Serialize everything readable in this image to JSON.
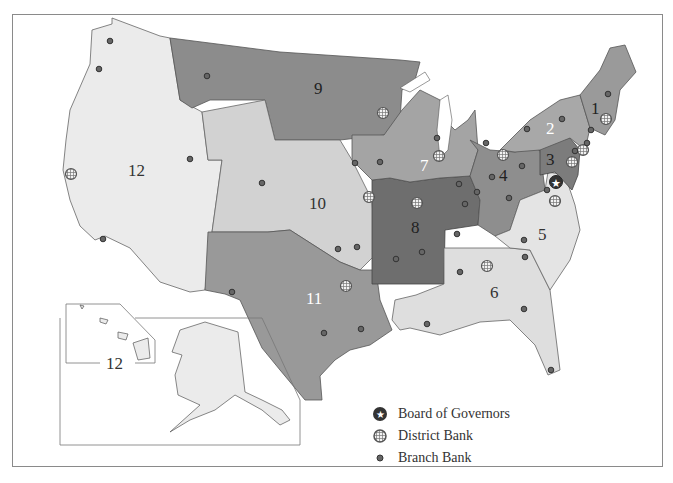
{
  "map": {
    "title": "Federal Reserve Districts",
    "colors": {
      "district_1": "#9a9a9a",
      "district_2": "#a8a8a8",
      "district_3": "#7c7c7c",
      "district_4": "#8e8e8e",
      "district_5": "#e4e4e4",
      "district_6": "#dedede",
      "district_7": "#a4a4a4",
      "district_8": "#6e6e6e",
      "district_9": "#8c8c8c",
      "district_10": "#d2d2d2",
      "district_11": "#999999",
      "district_12": "#ebebeb",
      "branch_marker": "#555555",
      "border": "#555555"
    },
    "district_labels": {
      "d1": "1",
      "d2": "2",
      "d3": "3",
      "d4": "4",
      "d5": "5",
      "d6": "6",
      "d7": "7",
      "d8": "8",
      "d9": "9",
      "d10": "10",
      "d11": "11",
      "d12": "12",
      "inset12": "12"
    },
    "inset": {
      "label": "12",
      "regions": [
        "Alaska",
        "Hawaii"
      ]
    }
  },
  "legend": {
    "items": [
      {
        "icon": "star-circle-icon",
        "label": "Board of Governors"
      },
      {
        "icon": "hatched-circle-icon",
        "label": "District Bank"
      },
      {
        "icon": "dot-icon",
        "label": "Branch Bank"
      }
    ]
  }
}
